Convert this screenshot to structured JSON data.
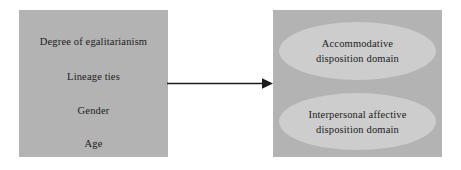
{
  "figure": {
    "type": "flow-diagram",
    "background_color": "#ffffff",
    "box_fill_color": "#b3b3b3",
    "ellipse_fill_color": "#cdcdcd",
    "text_color": "#1c1c1c",
    "arrow_color": "#1c1c1c"
  },
  "predictors_box": {
    "name": "predictor-variables",
    "lines": [
      "Degree of egalitarianism",
      "Lineage ties",
      "Gender",
      "Age"
    ]
  },
  "arrow": {
    "name": "leads-to-arrow",
    "direction": "right",
    "label": ""
  },
  "domains_box": {
    "name": "disposition-domains",
    "ellipses": [
      {
        "name": "accommodative-disposition-domain",
        "lines": [
          "Accommodative",
          "disposition domain"
        ]
      },
      {
        "name": "interpersonal-affective-disposition-domain",
        "lines": [
          "Interpersonal affective",
          "disposition domain"
        ]
      }
    ]
  }
}
